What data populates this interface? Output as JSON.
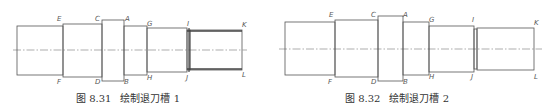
{
  "figures": [
    {
      "id": "fig-8-31",
      "caption_number": "图 8.31",
      "caption_text": "绘制退刀槽 1",
      "point_labels": {
        "E": "E",
        "F": "F",
        "C": "C",
        "D": "D",
        "A": "A",
        "B": "B",
        "G": "G",
        "H": "H",
        "I": "I",
        "J": "J",
        "K": "K",
        "L": "L"
      },
      "groove_style": "thread"
    },
    {
      "id": "fig-8-32",
      "caption_number": "图 8.32",
      "caption_text": "绘制退刀槽 2",
      "point_labels": {
        "E": "E",
        "F": "F",
        "C": "C",
        "D": "D",
        "A": "A",
        "B": "B",
        "G": "G",
        "H": "H",
        "I": "I",
        "J": "J",
        "K": "K",
        "L": "L"
      },
      "groove_style": "step"
    }
  ],
  "colors": {
    "outline": "#555555",
    "centerline": "#777777",
    "caption": "#333333"
  }
}
